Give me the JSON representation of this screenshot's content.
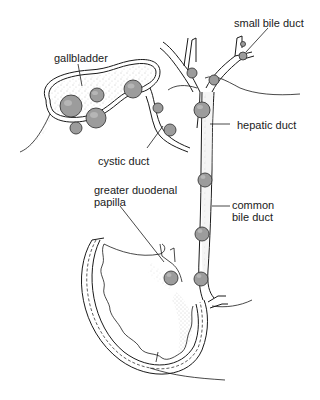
{
  "diagram": {
    "type": "anatomical-illustration",
    "labels": {
      "gallbladder": "gallbladder",
      "small_bile_duct": "small bile duct",
      "hepatic_duct": "hepatic duct",
      "cystic_duct": "cystic duct",
      "greater_duodenal_papilla_line1": "greater duodenal",
      "greater_duodenal_papilla_line2": "papilla",
      "common_bile_duct_line1": "common",
      "common_bile_duct_line2": "bile duct"
    },
    "colors": {
      "line": "#1a1a1a",
      "stone_fill": "#9c9c9c",
      "stone_highlight": "#cfcfcf",
      "background": "#ffffff"
    }
  }
}
